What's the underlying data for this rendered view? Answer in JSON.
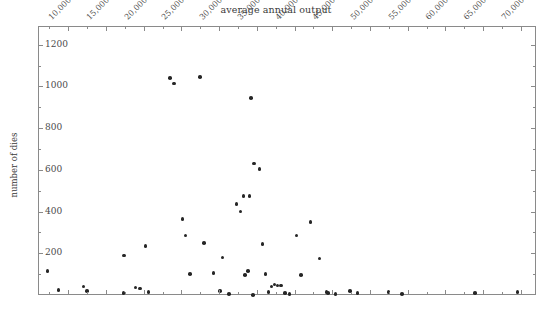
{
  "chart_data": {
    "type": "scatter",
    "title": "average annual output",
    "xlabel": "",
    "ylabel": "number of dies",
    "xlim": [
      6000,
      72000
    ],
    "ylim": [
      0,
      1290
    ],
    "grid": false,
    "legend": "none",
    "xticks": [
      {
        "value": 10000,
        "label": "10,000"
      },
      {
        "value": 15000,
        "label": "15,000"
      },
      {
        "value": 20000,
        "label": "20,000"
      },
      {
        "value": 25000,
        "label": "25,000"
      },
      {
        "value": 30000,
        "label": "30,000"
      },
      {
        "value": 35000,
        "label": "35,000"
      },
      {
        "value": 40000,
        "label": "40,000"
      },
      {
        "value": 45000,
        "label": "45,000"
      },
      {
        "value": 50000,
        "label": "50,000"
      },
      {
        "value": 55000,
        "label": "55,000"
      },
      {
        "value": 60000,
        "label": "60,000"
      },
      {
        "value": 65000,
        "label": "65,000"
      },
      {
        "value": 70000,
        "label": "70,000"
      }
    ],
    "yticks": [
      {
        "value": 200,
        "label": "200"
      },
      {
        "value": 400,
        "label": "400"
      },
      {
        "value": 600,
        "label": "600"
      },
      {
        "value": 800,
        "label": "800"
      },
      {
        "value": 1000,
        "label": "1000"
      },
      {
        "value": 1200,
        "label": "1200"
      }
    ],
    "x": [
      7150,
      8600,
      11900,
      12400,
      17200,
      17300,
      18800,
      19400,
      20100,
      20500,
      23400,
      23900,
      25000,
      25400,
      26000,
      27300,
      27900,
      29100,
      30000,
      30300,
      31200,
      32200,
      32700,
      33100,
      33300,
      33700,
      33900,
      34100,
      34400,
      34500,
      35200,
      35600,
      36000,
      36400,
      36800,
      37200,
      37600,
      38100,
      38600,
      39200,
      40100,
      40700,
      42000,
      43200,
      44100,
      44300,
      45300,
      47200,
      48200,
      52300,
      54100,
      63800,
      69400
    ],
    "y": [
      120,
      30,
      45,
      25,
      15,
      195,
      40,
      35,
      240,
      20,
      1045,
      1020,
      370,
      290,
      105,
      1050,
      255,
      110,
      25,
      185,
      10,
      440,
      405,
      480,
      100,
      120,
      480,
      950,
      5,
      635,
      610,
      250,
      105,
      20,
      45,
      55,
      50,
      50,
      15,
      10,
      290,
      100,
      355,
      180,
      20,
      15,
      10,
      25,
      15,
      20,
      10,
      15,
      20
    ],
    "marker": {
      "shape": "circle",
      "color": "#262626",
      "size": 3.6
    }
  },
  "axes": {
    "frame_color": "#8a8a8a",
    "text_color": "#4a4a4a",
    "background": "#ffffff"
  }
}
